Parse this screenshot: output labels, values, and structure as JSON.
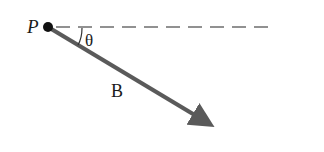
{
  "diagram": {
    "type": "vector-angle",
    "point_label": "P",
    "vector_label": "B",
    "angle_label": "θ",
    "colors": {
      "vector": "#5a5a5a",
      "dashed_line": "#6e6e6e",
      "point": "#111111",
      "text": "#1a1a1a",
      "background": "#ffffff"
    },
    "geometry": {
      "point": [
        48,
        27
      ],
      "vector_tip": [
        216,
        128
      ],
      "reference_line_end": [
        272,
        27
      ]
    }
  }
}
